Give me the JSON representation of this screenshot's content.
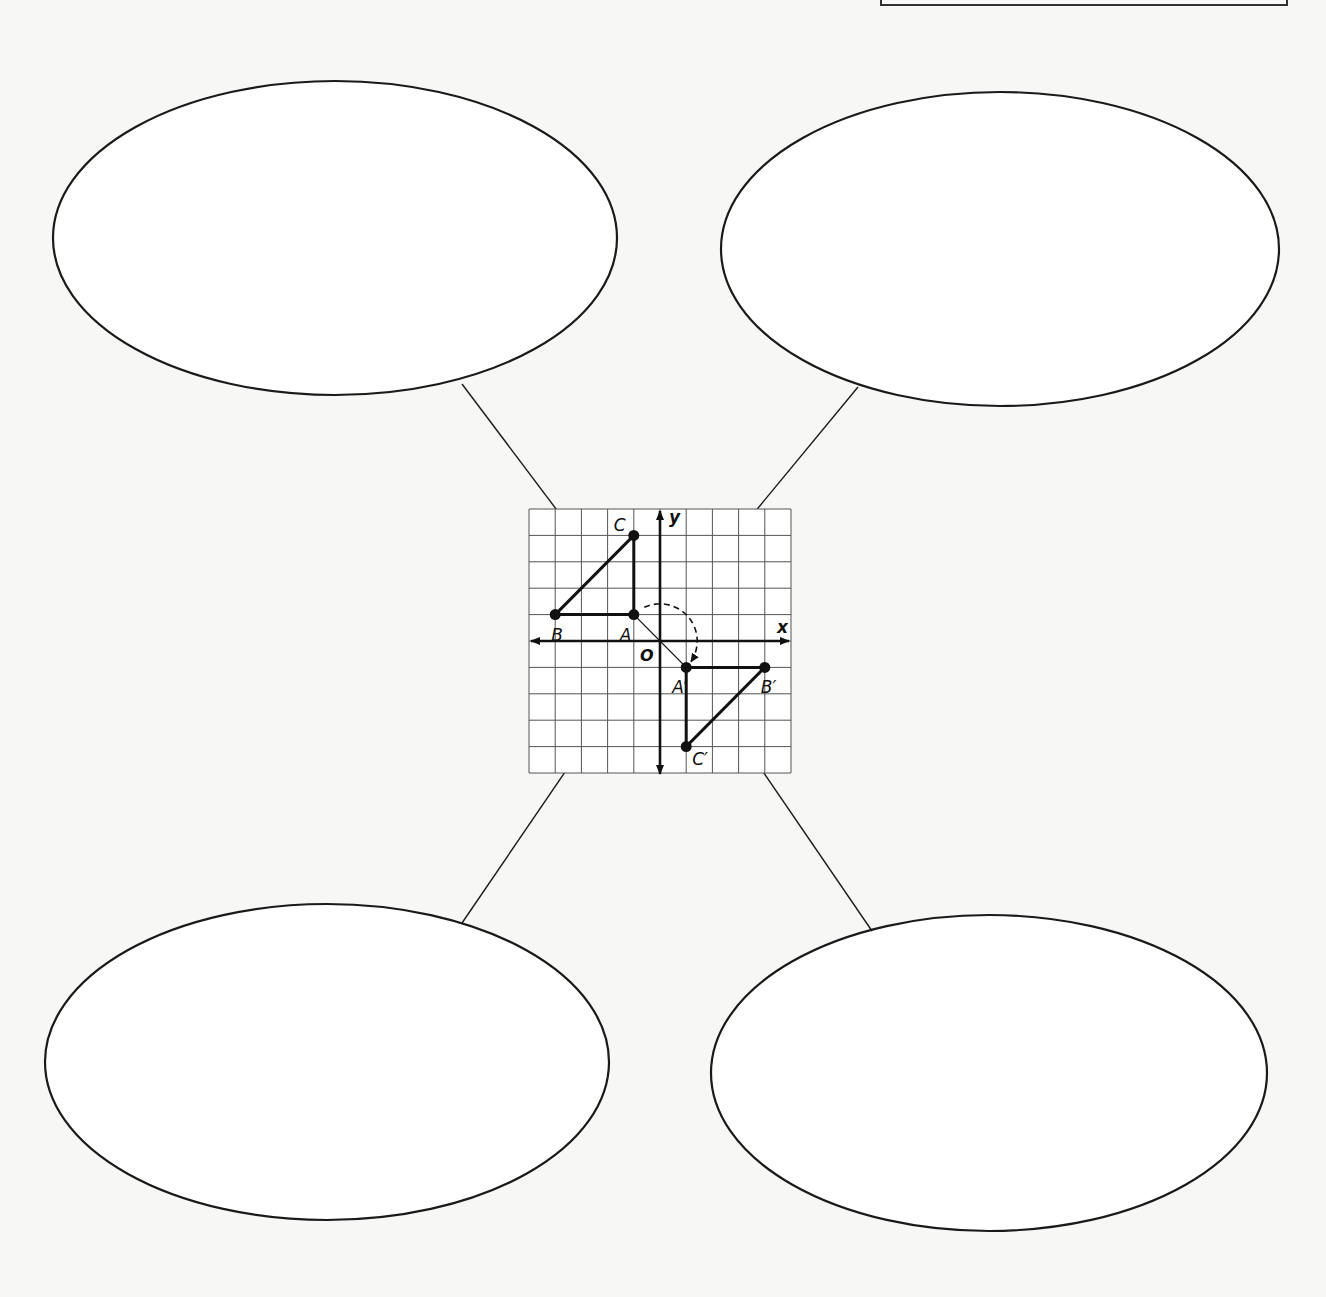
{
  "page": {
    "width": 1326,
    "height": 1297,
    "background": "#f7f7f5",
    "top_frame": {
      "x": 880,
      "width": 404
    }
  },
  "bubbles": [
    {
      "id": "top-left",
      "cx": 335,
      "cy": 238,
      "rx": 282,
      "ry": 157,
      "text": ""
    },
    {
      "id": "top-right",
      "cx": 1000,
      "cy": 249,
      "rx": 279,
      "ry": 157,
      "text": ""
    },
    {
      "id": "bottom-left",
      "cx": 327,
      "cy": 1062,
      "rx": 282,
      "ry": 158,
      "text": ""
    },
    {
      "id": "bottom-right",
      "cx": 989,
      "cy": 1073,
      "rx": 278,
      "ry": 158,
      "text": ""
    }
  ],
  "connectors": [
    {
      "id": "top-left",
      "from": [
        462,
        384
      ],
      "to": [
        611,
        582
      ]
    },
    {
      "id": "top-right",
      "from": [
        858,
        387
      ],
      "to": [
        697,
        582
      ]
    },
    {
      "id": "bottom-left",
      "from": [
        462,
        923
      ],
      "to": [
        636,
        668
      ]
    },
    {
      "id": "bottom-right",
      "from": [
        872,
        931
      ],
      "to": [
        716,
        703
      ]
    }
  ],
  "graph": {
    "left": 529,
    "top": 509,
    "cell_w": 26.2,
    "cell_h": 26.4,
    "xmin": -5,
    "xmax": 5,
    "ymin": -5,
    "ymax": 5,
    "x_axis_label": "x",
    "y_axis_label": "y",
    "origin_label": "O",
    "preimage": {
      "name": "triangle ABC",
      "points": [
        {
          "label": "A",
          "x": -1,
          "y": 1,
          "label_dx": -14,
          "label_dy": 26
        },
        {
          "label": "B",
          "x": -4,
          "y": 1,
          "label_dx": -4,
          "label_dy": 26
        },
        {
          "label": "C",
          "x": -1,
          "y": 4,
          "label_dx": -20,
          "label_dy": -4
        }
      ]
    },
    "image": {
      "name": "triangle A'B'C'",
      "points": [
        {
          "label": "A′",
          "x": 1,
          "y": -1,
          "label_dx": -14,
          "label_dy": 26
        },
        {
          "label": "B′",
          "x": 4,
          "y": -1,
          "label_dx": -4,
          "label_dy": 26
        },
        {
          "label": "C′",
          "x": 1,
          "y": -4,
          "label_dx": 6,
          "label_dy": 18
        }
      ]
    },
    "rotation": {
      "center": "O",
      "direction": "clockwise",
      "angle": 180,
      "from": "A",
      "to": "A′"
    }
  },
  "chart_data": {
    "type": "scatter",
    "title": "",
    "xlabel": "x",
    "ylabel": "y",
    "xlim": [
      -5,
      5
    ],
    "ylim": [
      -5,
      5
    ],
    "grid": true,
    "series": [
      {
        "name": "ABC",
        "points": [
          {
            "label": "A",
            "x": -1,
            "y": 1
          },
          {
            "label": "B",
            "x": -4,
            "y": 1
          },
          {
            "label": "C",
            "x": -1,
            "y": 4
          }
        ]
      },
      {
        "name": "A′B′C′",
        "points": [
          {
            "label": "A′",
            "x": 1,
            "y": -1
          },
          {
            "label": "B′",
            "x": 4,
            "y": -1
          },
          {
            "label": "C′",
            "x": 1,
            "y": -4
          }
        ]
      }
    ],
    "annotations": [
      "O (origin)",
      "dashed rotation arc from A to A′ about O"
    ]
  }
}
